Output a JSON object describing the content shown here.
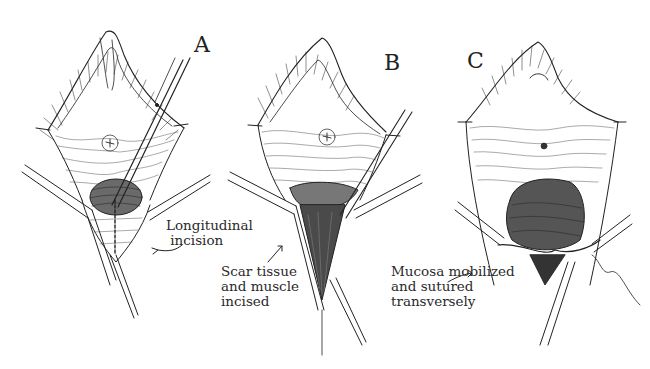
{
  "figure": {
    "panels": [
      {
        "id": "A",
        "label": "A",
        "caption": "Longitudinal\n incision"
      },
      {
        "id": "B",
        "label": "B",
        "caption": "Scar tissue\nand muscle\nincised"
      },
      {
        "id": "C",
        "label": "C",
        "caption": "Mucosa mobilized\nand sutured\ntransversely"
      }
    ],
    "colors": {
      "ink": "#222222",
      "background": "#ffffff"
    }
  }
}
